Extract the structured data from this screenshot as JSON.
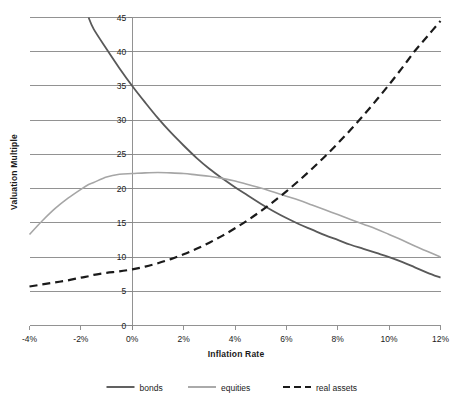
{
  "chart_data": {
    "type": "line",
    "title": "",
    "xlabel": "Inflation Rate",
    "ylabel": "Valuation Multiple",
    "xlim": [
      -4,
      12
    ],
    "ylim": [
      0,
      45
    ],
    "grid": true,
    "legend_position": "bottom",
    "xticks": [
      "-4%",
      "-2%",
      "0%",
      "2%",
      "4%",
      "6%",
      "8%",
      "10%",
      "12%"
    ],
    "xtick_values": [
      -4,
      -2,
      0,
      2,
      4,
      6,
      8,
      10,
      12
    ],
    "yticks": [
      "0",
      "5",
      "10",
      "15",
      "20",
      "25",
      "30",
      "35",
      "40",
      "45"
    ],
    "ytick_values": [
      0,
      5,
      10,
      15,
      20,
      25,
      30,
      35,
      40,
      45
    ],
    "x": [
      -4,
      -3.5,
      -3,
      -2.5,
      -2,
      -1.7,
      -1.5,
      -1,
      -0.5,
      0,
      0.5,
      1,
      1.5,
      2,
      2.5,
      3,
      3.5,
      4,
      4.5,
      5,
      5.5,
      6,
      6.5,
      7,
      7.5,
      8,
      8.5,
      9,
      9.5,
      10,
      10.5,
      11,
      11.5,
      12
    ],
    "series": [
      {
        "name": "bonds",
        "color": "#595959",
        "style": "solid",
        "width": 1.8,
        "clipped_above_axis": true,
        "values": [
          null,
          null,
          null,
          null,
          null,
          45.0,
          43.3,
          40.4,
          37.6,
          35.0,
          32.6,
          30.3,
          28.2,
          26.3,
          24.5,
          22.9,
          21.5,
          20.2,
          19.0,
          17.8,
          16.7,
          15.7,
          14.8,
          14.0,
          13.2,
          12.5,
          11.8,
          11.2,
          10.6,
          10.0,
          9.3,
          8.5,
          7.7,
          7.0
        ]
      },
      {
        "name": "equities",
        "color": "#a6a6a6",
        "style": "solid",
        "width": 1.6,
        "values": [
          13.3,
          15.3,
          17.1,
          18.6,
          19.9,
          20.6,
          20.9,
          21.7,
          22.1,
          22.2,
          22.3,
          22.35,
          22.3,
          22.2,
          22.0,
          21.8,
          21.5,
          21.1,
          20.6,
          20.1,
          19.5,
          18.9,
          18.3,
          17.6,
          16.9,
          16.2,
          15.5,
          14.8,
          14.1,
          13.3,
          12.5,
          11.6,
          10.8,
          10.0
        ]
      },
      {
        "name": "real assets",
        "color": "#1a1a1a",
        "style": "dashed",
        "width": 2.2,
        "values": [
          5.7,
          6.0,
          6.3,
          6.6,
          7.0,
          7.2,
          7.4,
          7.7,
          7.9,
          8.2,
          8.6,
          9.1,
          9.7,
          10.4,
          11.2,
          12.1,
          13.1,
          14.2,
          15.4,
          16.7,
          18.1,
          19.6,
          21.2,
          22.9,
          24.7,
          26.6,
          28.6,
          30.7,
          32.9,
          35.2,
          37.6,
          40.1,
          42.3,
          44.5
        ]
      }
    ]
  },
  "legend": {
    "items": [
      {
        "label": "bonds",
        "color": "#595959",
        "style": "solid"
      },
      {
        "label": "equities",
        "color": "#a6a6a6",
        "style": "solid"
      },
      {
        "label": "real assets",
        "color": "#1a1a1a",
        "style": "dashed"
      }
    ]
  },
  "colors": {
    "gridline": "#868686",
    "axis": "#868686",
    "bonds": "#595959",
    "equities": "#a6a6a6",
    "real_assets": "#1a1a1a",
    "background": "#ffffff"
  }
}
